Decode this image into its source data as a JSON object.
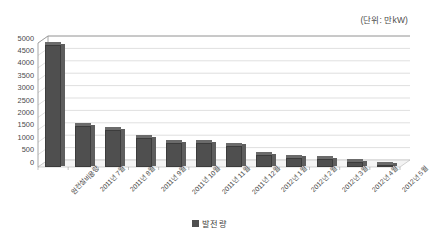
{
  "chart_data": {
    "type": "bar",
    "title": "",
    "subtitle": "",
    "unit_note": "(단위: 만kW)",
    "xlabel": "",
    "ylabel": "",
    "ylim": [
      0,
      5000
    ],
    "ytick_step": 500,
    "grid": true,
    "legend_position": "bottom",
    "categories": [
      "원전설비용량",
      "2011년 7월",
      "2011년 8월",
      "2011년 9월",
      "2011년 10월",
      "2011년 11월",
      "2011년 12월",
      "2012년 1월",
      "2012년 2월",
      "2012년 3월",
      "2012년 4월",
      "2012년 5월"
    ],
    "ytick_labels": [
      "5000",
      "4500",
      "4000",
      "3500",
      "3000",
      "2500",
      "2000",
      "1500",
      "1000",
      "500",
      "0"
    ],
    "series": [
      {
        "name": "발전량",
        "color": "#4f4f4f",
        "values": [
          4900,
          1650,
          1480,
          1150,
          950,
          950,
          850,
          480,
          380,
          320,
          200,
          90
        ]
      }
    ]
  },
  "legend": {
    "entries": [
      {
        "label": "발전량",
        "marker": "filled-square"
      }
    ]
  },
  "colors": {
    "bar": "#4f4f4f",
    "bar_top": "#6b6b6b",
    "bar_side": "#5e5e5e",
    "grid": "#c9c9c9",
    "axis": "#8f8f8f",
    "text": "#3a3a3a"
  }
}
